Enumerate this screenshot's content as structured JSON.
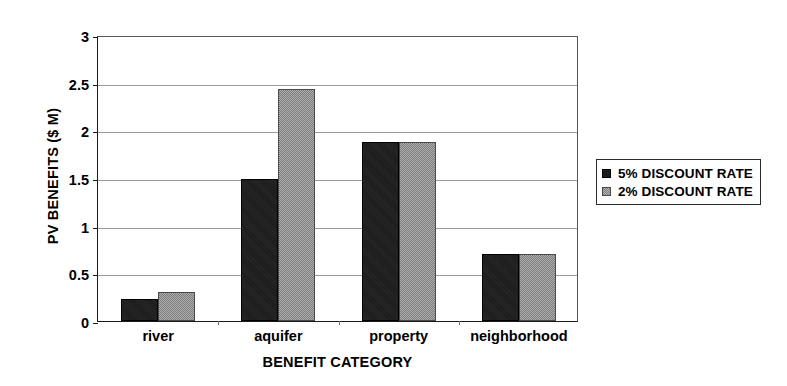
{
  "chart_data": {
    "type": "bar",
    "title": "",
    "xlabel": "BENEFIT CATEGORY",
    "ylabel": "PV BENEFITS ($ M)",
    "categories": [
      "river",
      "aquifer",
      "property",
      "neighborhood"
    ],
    "series": [
      {
        "name": "5% DISCOUNT RATE",
        "color": "#1c1c1c",
        "values": [
          0.23,
          1.49,
          1.88,
          0.7
        ]
      },
      {
        "name": "2% DISCOUNT RATE",
        "color": "#8c8c8c",
        "values": [
          0.3,
          2.43,
          1.88,
          0.7
        ]
      }
    ],
    "ylim": [
      0,
      3
    ],
    "yticks": [
      0,
      0.5,
      1,
      1.5,
      2,
      2.5,
      3
    ],
    "ytick_labels": [
      "0",
      "0.5",
      "1",
      "1.5",
      "2",
      "2.5",
      "3"
    ],
    "grid": true,
    "grid_axis": "y",
    "legend_position": "right",
    "legend_entries": [
      "5% DISCOUNT RATE",
      "2% DISCOUNT RATE"
    ]
  }
}
